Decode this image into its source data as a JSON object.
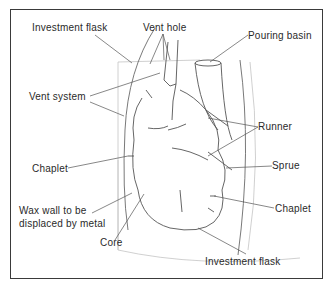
{
  "diagram": {
    "title": "",
    "labels": {
      "investment_flask_top": "Investment flask",
      "vent_hole": "Vent hole",
      "pouring_basin": "Pouring basin",
      "vent_system": "Vent system",
      "runner": "Runner",
      "chaplet_left": "Chaplet",
      "sprue": "Sprue",
      "wax_wall_line1": "Wax wall to be",
      "wax_wall_line2": "displaced by metal",
      "chaplet_right": "Chaplet",
      "core": "Core",
      "investment_flask_bottom": "Investment flask"
    },
    "colors": {
      "line": "#555555",
      "faint_line": "#b8b8b8",
      "text": "#2a2a2a",
      "frame": "#3a3a3a"
    }
  }
}
